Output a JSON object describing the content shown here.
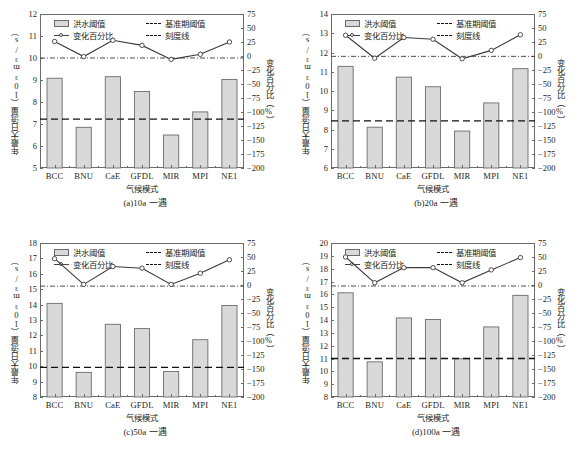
{
  "figure": {
    "categories": [
      "BCC",
      "BNU",
      "CaE",
      "GFDL",
      "MIR",
      "MPI",
      "NE1"
    ],
    "xlabel": "气候模式",
    "ylabel_left": "年最大日流量（10³m³/s）",
    "ylabel_right": "变化百分比（%）",
    "legend": {
      "bar": "洪水阈值",
      "baseline": "基准期阈值",
      "percent": "变化百分比",
      "gridline": "刻度线"
    },
    "colors": {
      "bar_fill": "#d9d9d9",
      "bar_stroke": "#6b6b6b",
      "line": "#3b3b3b",
      "baseline": "#111111",
      "axis": "#6b6b6b"
    },
    "right_axis": {
      "ticks": [
        75,
        50,
        25,
        0,
        -25,
        -50,
        -75,
        -100,
        -125,
        -150,
        -175,
        -200
      ],
      "ylim": [
        -200,
        75
      ]
    }
  },
  "chart_data": [
    {
      "type": "bar",
      "panel": "a",
      "title": "(a)10a 一遇",
      "categories": [
        "BCC",
        "BNU",
        "CaE",
        "GFDL",
        "MIR",
        "MPI",
        "NE1"
      ],
      "xlabel": "气候模式",
      "ylabel": "年最大日流量（10³m³/s）",
      "ylabel_right": "变化百分比（%）",
      "ylim": [
        5,
        12
      ],
      "yticks": [
        5,
        6,
        7,
        8,
        9,
        10,
        11,
        12
      ],
      "ylim_right": [
        -200,
        75
      ],
      "grid": false,
      "legend_position": "top-inside",
      "series": [
        {
          "name": "洪水阈值",
          "type": "bar",
          "values": [
            9.08,
            6.85,
            9.15,
            8.48,
            6.5,
            7.55,
            9.02
          ]
        },
        {
          "name": "变化百分比",
          "type": "line",
          "axis": "right",
          "values": [
            26,
            -1,
            28,
            19,
            -6,
            3,
            25
          ]
        }
      ],
      "baseline_threshold": 7.22,
      "zero_percent_line": 10.0
    },
    {
      "type": "bar",
      "panel": "b",
      "title": "(b)20a 一遇",
      "categories": [
        "BCC",
        "BNU",
        "CaE",
        "GFDL",
        "MIR",
        "MPI",
        "NE1"
      ],
      "xlabel": "气候模式",
      "ylabel": "年最大日流量（10³m³/s）",
      "ylabel_right": "变化百分比（%）",
      "ylim": [
        6,
        14
      ],
      "yticks": [
        6,
        7,
        8,
        9,
        10,
        11,
        12,
        13,
        14
      ],
      "ylim_right": [
        -200,
        75
      ],
      "grid": false,
      "legend_position": "top-inside",
      "series": [
        {
          "name": "洪水阈值",
          "type": "bar",
          "values": [
            11.28,
            8.12,
            10.72,
            10.22,
            7.92,
            9.38,
            11.16
          ]
        },
        {
          "name": "变化百分比",
          "type": "line",
          "axis": "right",
          "values": [
            37,
            -4,
            33,
            30,
            -5,
            10,
            38
          ]
        }
      ],
      "baseline_threshold": 8.45,
      "zero_percent_line": 11.8
    },
    {
      "type": "bar",
      "panel": "c",
      "title": "(c)50a 一遇",
      "categories": [
        "BCC",
        "BNU",
        "CaE",
        "GFDL",
        "MIR",
        "MPI",
        "NE1"
      ],
      "xlabel": "气候模式",
      "ylabel": "年最大日流量（10³m³/s）",
      "ylabel_right": "变化百分比（%）",
      "ylim": [
        8,
        18
      ],
      "yticks": [
        8,
        9,
        10,
        11,
        12,
        13,
        14,
        15,
        16,
        17,
        18
      ],
      "ylim_right": [
        -200,
        75
      ],
      "grid": false,
      "legend_position": "top-inside",
      "series": [
        {
          "name": "洪水阈值",
          "type": "bar",
          "values": [
            14.08,
            9.6,
            12.72,
            12.44,
            9.66,
            11.72,
            13.94
          ]
        },
        {
          "name": "变化百分比",
          "type": "line",
          "axis": "right",
          "values": [
            47,
            1,
            33,
            30,
            1,
            21,
            45
          ]
        }
      ],
      "baseline_threshold": 9.93,
      "zero_percent_line": 15.2
    },
    {
      "type": "bar",
      "panel": "d",
      "title": "(d)100a 一遇",
      "categories": [
        "BCC",
        "BNU",
        "CaE",
        "GFDL",
        "MIR",
        "MPI",
        "NE1"
      ],
      "xlabel": "气候模式",
      "ylabel": "年最大日流量（10³m³/s）",
      "ylabel_right": "变化百分比（%）",
      "ylim": [
        8,
        20
      ],
      "yticks": [
        8,
        9,
        10,
        11,
        12,
        13,
        14,
        15,
        16,
        17,
        18,
        19,
        20
      ],
      "ylim_right": [
        -200,
        75
      ],
      "grid": false,
      "legend_position": "top-inside",
      "series": [
        {
          "name": "洪水阈值",
          "type": "bar",
          "values": [
            16.12,
            10.74,
            14.16,
            14.04,
            10.98,
            13.46,
            15.92
          ]
        },
        {
          "name": "变化百分比",
          "type": "line",
          "axis": "right",
          "values": [
            50,
            4,
            31,
            31,
            4,
            27,
            49
          ]
        }
      ],
      "baseline_threshold": 11.0,
      "zero_percent_line": 16.65
    }
  ]
}
